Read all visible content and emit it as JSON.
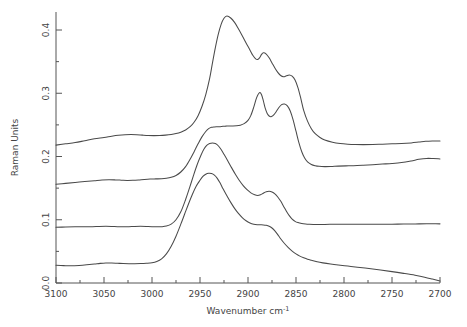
{
  "chart_data": {
    "type": "line",
    "title": "",
    "xlabel": "Wavenumber  cm",
    "xlabel_sup": "-1",
    "ylabel": "Raman Units",
    "xlim": [
      3100,
      2700
    ],
    "xreversed": true,
    "ylim": [
      0.0,
      0.43
    ],
    "grid": false,
    "legend": "none",
    "xticks": [
      3100,
      3050,
      3000,
      2950,
      2900,
      2850,
      2800,
      2750,
      2700
    ],
    "xticklabels": [
      "3100",
      "3050",
      "3000",
      "2950",
      "2900",
      "2850",
      "2800",
      "2750",
      "2700"
    ],
    "xminorticks": [
      3075,
      3025,
      2975,
      2925,
      2875,
      2825,
      2775,
      2725
    ],
    "yticks": [
      0.0,
      0.1,
      0.2,
      0.3,
      0.4
    ],
    "yticklabels": [
      "0.0",
      "0.1",
      "0.2",
      "0.3",
      "0.4"
    ],
    "yminorticks": [
      0.05,
      0.15,
      0.25,
      0.35
    ],
    "series": [
      {
        "name": "spectrum-1",
        "baseline_offset": 0.218,
        "x": [
          3100,
          3090,
          3080,
          3070,
          3060,
          3050,
          3042,
          3035,
          3028,
          3022,
          3016,
          3010,
          3004,
          2998,
          2992,
          2986,
          2980,
          2975,
          2970,
          2965,
          2960,
          2956,
          2952,
          2948,
          2944,
          2940,
          2937,
          2934,
          2931,
          2928,
          2925,
          2922,
          2918,
          2914,
          2910,
          2906,
          2902,
          2898,
          2895,
          2892,
          2890,
          2888,
          2886,
          2884,
          2881,
          2878,
          2875,
          2872,
          2869,
          2866,
          2863,
          2860,
          2857,
          2854,
          2851,
          2848,
          2845,
          2842,
          2838,
          2834,
          2830,
          2825,
          2820,
          2812,
          2804,
          2796,
          2788,
          2780,
          2770,
          2760,
          2750,
          2740,
          2730,
          2722,
          2715,
          2708,
          2700
        ],
        "y": [
          0.218,
          0.22,
          0.222,
          0.225,
          0.228,
          0.23,
          0.232,
          0.2335,
          0.2345,
          0.2348,
          0.2345,
          0.2338,
          0.2332,
          0.233,
          0.2332,
          0.2338,
          0.2348,
          0.2362,
          0.2385,
          0.242,
          0.2475,
          0.2545,
          0.2645,
          0.279,
          0.298,
          0.323,
          0.348,
          0.372,
          0.393,
          0.409,
          0.4185,
          0.422,
          0.419,
          0.412,
          0.402,
          0.391,
          0.3795,
          0.3685,
          0.36,
          0.3545,
          0.3535,
          0.356,
          0.361,
          0.364,
          0.362,
          0.356,
          0.348,
          0.34,
          0.333,
          0.328,
          0.326,
          0.3275,
          0.329,
          0.327,
          0.321,
          0.309,
          0.292,
          0.273,
          0.256,
          0.244,
          0.236,
          0.23,
          0.226,
          0.2225,
          0.2205,
          0.2195,
          0.219,
          0.2188,
          0.219,
          0.2195,
          0.22,
          0.2205,
          0.2215,
          0.2228,
          0.224,
          0.2245,
          0.2245
        ]
      },
      {
        "name": "spectrum-2",
        "baseline_offset": 0.156,
        "x": [
          3100,
          3090,
          3080,
          3070,
          3060,
          3052,
          3045,
          3038,
          3032,
          3026,
          3020,
          3014,
          3008,
          3002,
          2996,
          2990,
          2985,
          2980,
          2975,
          2970,
          2965,
          2960,
          2956,
          2952,
          2948,
          2944,
          2941,
          2938,
          2935,
          2932,
          2929,
          2926,
          2923,
          2920,
          2916,
          2912,
          2908,
          2904,
          2900,
          2897,
          2894,
          2891,
          2888,
          2886,
          2884,
          2882,
          2880,
          2878,
          2876,
          2874,
          2871,
          2868,
          2865,
          2862,
          2859,
          2856,
          2853,
          2850,
          2847,
          2844,
          2841,
          2838,
          2834,
          2830,
          2826,
          2820,
          2814,
          2806,
          2798,
          2790,
          2780,
          2770,
          2760,
          2750,
          2740,
          2730,
          2722,
          2714,
          2707,
          2700
        ],
        "y": [
          0.156,
          0.1575,
          0.159,
          0.1605,
          0.1618,
          0.1628,
          0.1632,
          0.163,
          0.1626,
          0.1622,
          0.1624,
          0.163,
          0.1638,
          0.1644,
          0.1646,
          0.1648,
          0.1655,
          0.167,
          0.17,
          0.1755,
          0.184,
          0.1965,
          0.208,
          0.22,
          0.231,
          0.2395,
          0.244,
          0.2462,
          0.2468,
          0.247,
          0.2472,
          0.2478,
          0.248,
          0.2482,
          0.2482,
          0.2485,
          0.2495,
          0.252,
          0.257,
          0.265,
          0.278,
          0.293,
          0.301,
          0.298,
          0.288,
          0.276,
          0.268,
          0.264,
          0.263,
          0.2645,
          0.27,
          0.277,
          0.282,
          0.283,
          0.28,
          0.272,
          0.258,
          0.24,
          0.222,
          0.2075,
          0.1975,
          0.1915,
          0.1875,
          0.1855,
          0.1845,
          0.184,
          0.1842,
          0.1848,
          0.1852,
          0.1855,
          0.1862,
          0.187,
          0.188,
          0.189,
          0.1905,
          0.193,
          0.1955,
          0.197,
          0.1968,
          0.1962
        ]
      },
      {
        "name": "spectrum-3",
        "baseline_offset": 0.088,
        "x": [
          3100,
          3090,
          3080,
          3070,
          3062,
          3055,
          3048,
          3042,
          3036,
          3030,
          3024,
          3018,
          3012,
          3006,
          3000,
          2995,
          2990,
          2985,
          2980,
          2975,
          2970,
          2965,
          2961,
          2957,
          2953,
          2949,
          2946,
          2943,
          2940,
          2937,
          2934,
          2931,
          2928,
          2925,
          2921,
          2917,
          2913,
          2909,
          2905,
          2901,
          2897,
          2893,
          2890,
          2887,
          2884,
          2881,
          2878,
          2875,
          2872,
          2869,
          2866,
          2863,
          2860,
          2857,
          2854,
          2851,
          2848,
          2844,
          2840,
          2836,
          2832,
          2826,
          2820,
          2812,
          2804,
          2794,
          2784,
          2774,
          2762,
          2750,
          2738,
          2726,
          2714,
          2707,
          2700
        ],
        "y": [
          0.088,
          0.0885,
          0.0888,
          0.0888,
          0.089,
          0.0894,
          0.0896,
          0.0894,
          0.089,
          0.0888,
          0.089,
          0.0894,
          0.0896,
          0.0894,
          0.089,
          0.0888,
          0.089,
          0.09,
          0.093,
          0.1,
          0.1125,
          0.132,
          0.15,
          0.169,
          0.187,
          0.202,
          0.2115,
          0.2175,
          0.2205,
          0.2215,
          0.2205,
          0.217,
          0.211,
          0.2035,
          0.193,
          0.182,
          0.1715,
          0.162,
          0.154,
          0.1475,
          0.1425,
          0.1395,
          0.1385,
          0.1395,
          0.142,
          0.1442,
          0.145,
          0.144,
          0.141,
          0.136,
          0.1295,
          0.1215,
          0.1135,
          0.1065,
          0.101,
          0.0975,
          0.0955,
          0.094,
          0.0932,
          0.0928,
          0.0926,
          0.0925,
          0.0926,
          0.0928,
          0.0928,
          0.093,
          0.093,
          0.0929,
          0.0928,
          0.093,
          0.0932,
          0.0934,
          0.0936,
          0.0936,
          0.0935
        ]
      },
      {
        "name": "spectrum-4",
        "baseline_offset": 0.028,
        "x": [
          3100,
          3092,
          3084,
          3076,
          3068,
          3060,
          3054,
          3048,
          3042,
          3036,
          3030,
          3024,
          3018,
          3012,
          3006,
          3000,
          2995,
          2990,
          2985,
          2980,
          2975,
          2970,
          2966,
          2962,
          2958,
          2954,
          2950,
          2947,
          2944,
          2941,
          2938,
          2935,
          2932,
          2929,
          2926,
          2922,
          2918,
          2914,
          2910,
          2906,
          2902,
          2898,
          2894,
          2890,
          2887,
          2884,
          2881,
          2878,
          2875,
          2872,
          2869,
          2866,
          2862,
          2858,
          2854,
          2850,
          2846,
          2842,
          2838,
          2834,
          2828,
          2822,
          2814,
          2806,
          2796,
          2786,
          2774,
          2762,
          2750,
          2738,
          2726,
          2716,
          2708,
          2700
        ],
        "y": [
          0.028,
          0.0275,
          0.0272,
          0.0278,
          0.0288,
          0.03,
          0.031,
          0.0316,
          0.0316,
          0.0312,
          0.0308,
          0.0306,
          0.0306,
          0.0308,
          0.0312,
          0.032,
          0.034,
          0.0382,
          0.046,
          0.058,
          0.074,
          0.093,
          0.109,
          0.125,
          0.14,
          0.153,
          0.1625,
          0.1685,
          0.172,
          0.1735,
          0.173,
          0.1705,
          0.1655,
          0.158,
          0.149,
          0.138,
          0.1275,
          0.118,
          0.11,
          0.1035,
          0.0985,
          0.095,
          0.093,
          0.0922,
          0.092,
          0.0918,
          0.0912,
          0.0898,
          0.087,
          0.0825,
          0.0765,
          0.07,
          0.0625,
          0.056,
          0.0505,
          0.046,
          0.0425,
          0.0398,
          0.0375,
          0.0358,
          0.0335,
          0.0318,
          0.03,
          0.0285,
          0.0268,
          0.025,
          0.0228,
          0.0205,
          0.018,
          0.0152,
          0.0122,
          0.0092,
          0.0062,
          0.003
        ]
      }
    ]
  }
}
